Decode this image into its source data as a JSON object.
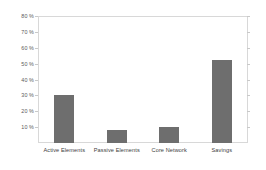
{
  "chart_data": {
    "type": "bar",
    "title": "",
    "subtitle": "",
    "xlabel": "",
    "ylabel": "",
    "categories": [
      "Active Elements",
      "Passive Elements",
      "Core Network",
      "Savings"
    ],
    "values": [
      30,
      8,
      10,
      52
    ],
    "value_unit": "%",
    "ylim": [
      0,
      80
    ],
    "ytick_values": [
      10,
      20,
      30,
      40,
      50,
      60,
      70,
      80
    ],
    "ytick_labels": [
      "10 %",
      "20 %",
      "30 %",
      "40 %",
      "50 %",
      "60 %",
      "70 %",
      "80 %"
    ],
    "grid": false,
    "legend": null,
    "legend_position": "none",
    "series": [
      {
        "name": "",
        "values": [
          30,
          8,
          10,
          52
        ],
        "color": "#6e6e6e"
      }
    ],
    "annotations": []
  },
  "style": {
    "bar_color": "#6e6e6e",
    "plot_border_color": "#d8d8d8",
    "tick_color": "#c9c9c9",
    "ytick_label_color": "#5a5a5a",
    "xtick_label_color": "#3d3d3d",
    "background_color": "#ffffff"
  }
}
